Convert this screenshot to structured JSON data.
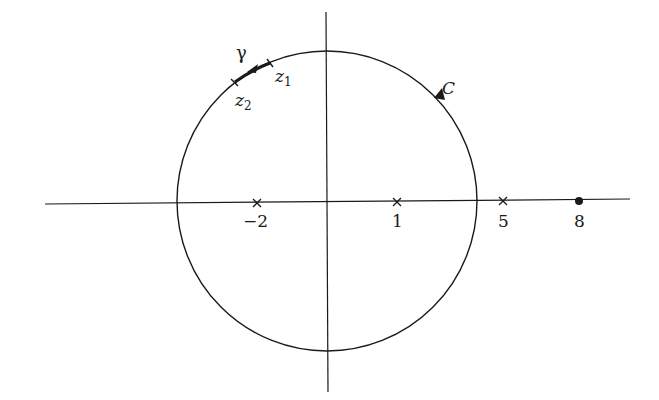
{
  "diagram": {
    "contour_label": "C",
    "arc_label": "γ",
    "arc_endpoints": [
      {
        "name": "z",
        "sub": "1"
      },
      {
        "name": "z",
        "sub": "2"
      }
    ],
    "axis_points": [
      {
        "value": "-2",
        "label": "−2",
        "marker": "cross"
      },
      {
        "value": "1",
        "label": "1",
        "marker": "cross"
      },
      {
        "value": "5",
        "label": "5",
        "marker": "cross"
      },
      {
        "value": "8",
        "label": "8",
        "marker": "dot"
      }
    ],
    "colors": {
      "ink": "#1a1a1a",
      "background": "#ffffff"
    }
  }
}
